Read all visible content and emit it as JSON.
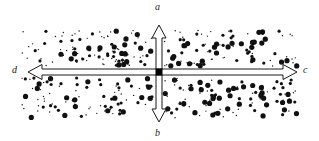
{
  "figure": {
    "kind": "diffusion-cross-diagram",
    "width": 319,
    "height": 141,
    "background_color": "#ffffff",
    "ink_color": "#1a1a1a"
  },
  "labels": {
    "top": "a",
    "bottom": "b",
    "right": "c",
    "left": "d"
  },
  "center_marker": {
    "name": "center-square",
    "x": 159,
    "y": 72,
    "size": 7,
    "color": "#000000"
  },
  "arrows": [
    {
      "name": "arrow-up",
      "label": "a",
      "direction": "up",
      "tail_x": 159,
      "tail_y": 72,
      "tip_x": 159,
      "tip_y": 25,
      "shaft_width": 6,
      "head_width": 14,
      "head_length": 13
    },
    {
      "name": "arrow-down",
      "label": "b",
      "direction": "down",
      "tail_x": 159,
      "tail_y": 72,
      "tip_x": 159,
      "tip_y": 122,
      "shaft_width": 6,
      "head_width": 14,
      "head_length": 13
    },
    {
      "name": "arrow-right",
      "label": "c",
      "direction": "right",
      "tail_x": 159,
      "tail_y": 72,
      "tip_x": 297,
      "tip_y": 72,
      "shaft_width": 6,
      "head_width": 15,
      "head_length": 14
    },
    {
      "name": "arrow-left",
      "label": "d",
      "direction": "left",
      "tail_x": 159,
      "tail_y": 72,
      "tip_x": 28,
      "tip_y": 72,
      "shaft_width": 6,
      "head_width": 15,
      "head_length": 14
    }
  ],
  "dot_field": {
    "name": "particle-scatter-field",
    "region": {
      "x_min": 22,
      "x_max": 298,
      "y_min": 30,
      "y_max": 118
    },
    "band_gap": {
      "y_min": 66,
      "y_max": 78
    },
    "color": "#111111",
    "size_classes": [
      {
        "name": "large",
        "radius": 2.6,
        "count": 96
      },
      {
        "name": "medium",
        "radius": 1.6,
        "count": 120
      },
      {
        "name": "small",
        "radius": 0.7,
        "count": 170
      }
    ],
    "seed": 20240617
  }
}
